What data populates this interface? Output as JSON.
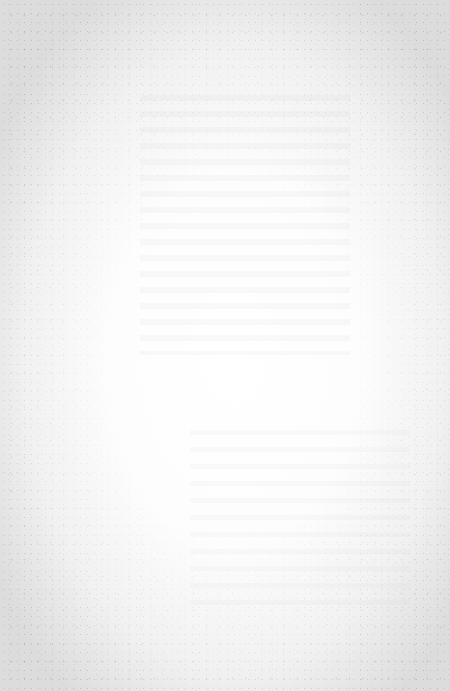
{
  "document": {
    "type": "blank-page",
    "visible_text": "",
    "paper_color": "#ffffff",
    "edge_tone": "#dcdcdc"
  }
}
